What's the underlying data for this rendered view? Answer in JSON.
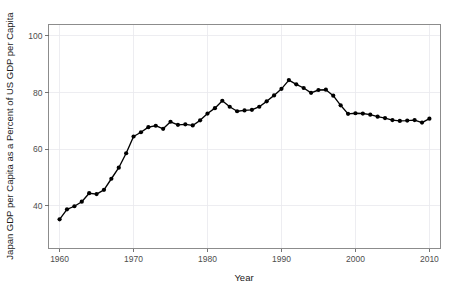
{
  "chart_data": {
    "type": "line",
    "title": "",
    "xlabel": "Year",
    "ylabel": "Japan GDP per Capita as a Percent of US GDP per Capita",
    "xlim": [
      1958.5,
      2011.5
    ],
    "ylim": [
      25.0,
      104.0
    ],
    "xticks": [
      1960,
      1970,
      1980,
      1990,
      2000,
      2010
    ],
    "xtick_labels": [
      "1960",
      "1970",
      "1980",
      "1990",
      "2000",
      "2010"
    ],
    "yticks": [
      40,
      60,
      80,
      100
    ],
    "ytick_labels": [
      "40",
      "60",
      "80",
      "100"
    ],
    "grid": true,
    "legend": "none",
    "marker": "circle",
    "line_color": "#000000",
    "marker_color": "#000000",
    "panel_background": "#ffffff",
    "grid_color": "#e9e9ed",
    "border_color": "#8c8c8c",
    "x": [
      1960,
      1961,
      1962,
      1963,
      1964,
      1965,
      1966,
      1967,
      1968,
      1969,
      1970,
      1971,
      1972,
      1973,
      1974,
      1975,
      1976,
      1977,
      1978,
      1979,
      1980,
      1981,
      1982,
      1983,
      1984,
      1985,
      1986,
      1987,
      1988,
      1989,
      1990,
      1991,
      1992,
      1993,
      1994,
      1995,
      1996,
      1997,
      1998,
      1999,
      2000,
      2001,
      2002,
      2003,
      2004,
      2005,
      2006,
      2007,
      2008,
      2009,
      2010
    ],
    "y": [
      35.3,
      38.8,
      39.9,
      41.5,
      44.5,
      44.2,
      45.7,
      49.6,
      53.5,
      58.6,
      64.5,
      66.0,
      67.8,
      68.3,
      67.2,
      69.7,
      68.6,
      68.8,
      68.4,
      70.2,
      72.6,
      74.5,
      77.1,
      75.0,
      73.4,
      73.7,
      73.9,
      75.0,
      76.9,
      79.0,
      81.3,
      84.4,
      82.9,
      81.6,
      79.9,
      80.9,
      81.0,
      78.9,
      75.5,
      72.5,
      72.7,
      72.6,
      72.2,
      71.5,
      71.0,
      70.3,
      70.0,
      70.1,
      70.3,
      69.4,
      70.8
    ]
  },
  "axes": {
    "y_title": "Japan GDP per Capita as a Percent of US GDP per Capita",
    "x_title": "Year"
  }
}
